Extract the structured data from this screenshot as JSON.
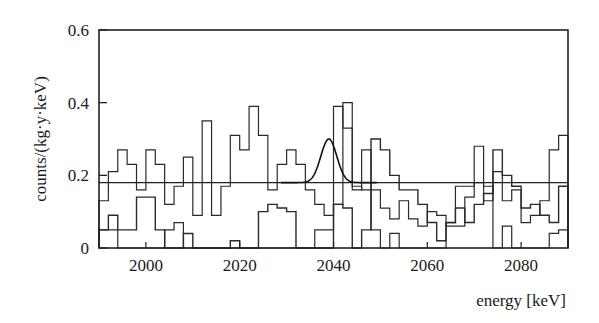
{
  "chart_data": {
    "type": "line",
    "subtype": "step-histogram",
    "title": "",
    "xlabel": "energy [keV]",
    "ylabel": "counts/(kg·y·keV)",
    "xlim": [
      1990,
      2090
    ],
    "ylim": [
      0,
      0.6
    ],
    "x_ticks": [
      2000,
      2020,
      2040,
      2060,
      2080
    ],
    "y_ticks": [
      0,
      0.2,
      0.4,
      0.6
    ],
    "y_tick_labels": [
      "0",
      "0.2",
      "0.4",
      "0.6"
    ],
    "x_tick_labels": [
      "2000",
      "2020",
      "2040",
      "2060",
      "2080"
    ],
    "grid": false,
    "legend": null,
    "bin_width_keV": 2,
    "bin_edges_start": 1990,
    "series": [
      {
        "name": "spectrum A (upper)",
        "style": "step",
        "values": [
          0.13,
          0.21,
          0.27,
          0.23,
          0.16,
          0.27,
          0.23,
          0.12,
          0.17,
          0.25,
          0.09,
          0.35,
          0.09,
          0.17,
          0.31,
          0.27,
          0.39,
          0.31,
          0.16,
          0.23,
          0.27,
          0.23,
          0.16,
          0.12,
          0.09,
          0.39,
          0.33,
          0.16,
          0.27,
          0.16,
          0.11,
          0.08,
          0.13,
          0.08,
          0.06,
          0.1,
          0.09,
          0.06,
          0.06,
          0.14,
          0.28,
          0.13,
          0.21,
          0.13,
          0.16,
          0.07,
          0.09,
          0.13,
          0.27,
          0.31
        ]
      },
      {
        "name": "spectrum B (middle)",
        "style": "step",
        "values": [
          0.05,
          0.09,
          0.05,
          0.05,
          0.14,
          0.14,
          0.05,
          0.0,
          0.0,
          0.04,
          0.0,
          0.0,
          0.0,
          0.0,
          0.02,
          0.0,
          0.0,
          0.1,
          0.12,
          0.11,
          0.1,
          0.0,
          0.0,
          0.0,
          0.0,
          0.12,
          0.11,
          0.0,
          0.05,
          0.3,
          0.27,
          0.2,
          0.16,
          0.16,
          0.12,
          0.07,
          0.02,
          0.07,
          0.11,
          0.07,
          0.12,
          0.15,
          0.27,
          0.2,
          0.17,
          0.11,
          0.12,
          0.09,
          0.07,
          0.17
        ]
      },
      {
        "name": "spectrum C (lower)",
        "style": "step",
        "values": [
          0.05,
          0.05,
          0.0,
          0.0,
          0.0,
          0.0,
          0.0,
          0.05,
          0.07,
          0.0,
          0.0,
          0.0,
          0.0,
          0.0,
          0.0,
          0.0,
          0.0,
          0.0,
          0.0,
          0.0,
          0.0,
          0.0,
          0.0,
          0.05,
          0.05,
          0.12,
          0.4,
          0.17,
          0.16,
          0.05,
          0.0,
          0.04,
          0.0,
          0.0,
          0.0,
          0.0,
          0.0,
          0.07,
          0.17,
          0.17,
          0.18,
          0.17,
          0.0,
          0.06,
          0.0,
          0.0,
          0.0,
          0.0,
          0.04,
          0.05
        ]
      },
      {
        "name": "background level",
        "style": "flat-line",
        "value": 0.18
      },
      {
        "name": "Gaussian peak fit",
        "style": "curve",
        "center_keV": 2039,
        "sigma_keV": 1.7,
        "baseline": 0.18,
        "peak": 0.3
      }
    ],
    "annotations": []
  }
}
